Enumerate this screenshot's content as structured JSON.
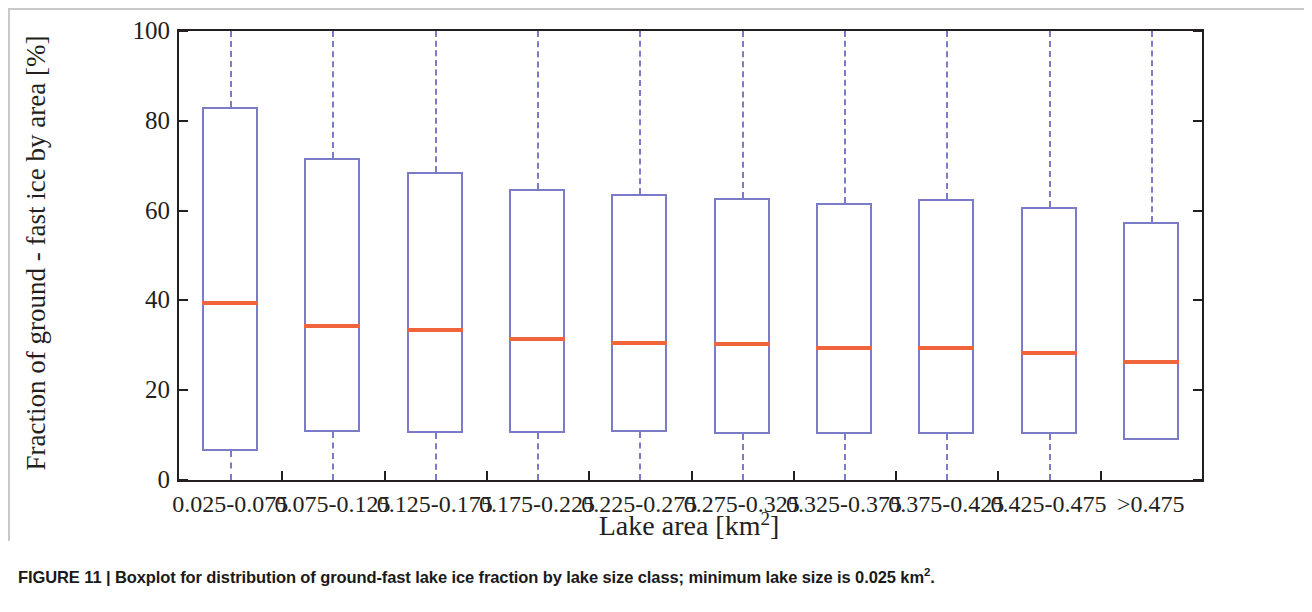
{
  "caption": {
    "figure_number": "FIGURE 11",
    "separator": "|",
    "text_before_sup": "Boxplot for distribution of ground-fast lake ice fraction by lake size class; minimum lake size is 0.025 km",
    "superscript": "2",
    "text_after_sup": "."
  },
  "colors": {
    "box_edge": "#7b7bc8",
    "median": "#f0643c",
    "axis": "#231f20",
    "background": "#ffffff",
    "outer_frame": "#c9c9c9"
  },
  "chart_data": {
    "type": "box",
    "title": "",
    "subtitle": "",
    "xlabel_text": "Lake area [km",
    "xlabel_sup": "2",
    "xlabel_tail": "]",
    "ylabel": "Fraction of ground - fast ice by area [%]",
    "ylim": [
      0,
      100
    ],
    "yticks": [
      0,
      20,
      40,
      60,
      80,
      100
    ],
    "ytick_labels": [
      "0",
      "20",
      "40",
      "60",
      "80",
      "100"
    ],
    "grid": false,
    "legend": "none",
    "categories": [
      "0.025-0.075",
      "0.075-0.125",
      "0.125-0.175",
      "0.175-0.225",
      "0.225-0.275",
      "0.275-0.325",
      "0.325-0.375",
      "0.375-0.425",
      "0.425-0.475",
      ">0.475"
    ],
    "boxes": [
      {
        "category": "0.025-0.075",
        "whisker_low": 0.0,
        "q1": 6.5,
        "median": 39.8,
        "q3": 83.0,
        "whisker_high": 100.0
      },
      {
        "category": "0.075-0.125",
        "whisker_low": 0.0,
        "q1": 10.7,
        "median": 34.8,
        "q3": 71.7,
        "whisker_high": 100.0
      },
      {
        "category": "0.125-0.175",
        "whisker_low": 0.0,
        "q1": 10.5,
        "median": 33.8,
        "q3": 68.7,
        "whisker_high": 100.0
      },
      {
        "category": "0.175-0.225",
        "whisker_low": 0.0,
        "q1": 10.4,
        "median": 31.8,
        "q3": 64.8,
        "whisker_high": 100.0
      },
      {
        "category": "0.225-0.275",
        "whisker_low": 0.0,
        "q1": 10.7,
        "median": 30.9,
        "q3": 63.8,
        "whisker_high": 100.0
      },
      {
        "category": "0.275-0.325",
        "whisker_low": 0.0,
        "q1": 10.3,
        "median": 30.8,
        "q3": 62.8,
        "whisker_high": 100.0
      },
      {
        "category": "0.325-0.375",
        "whisker_low": 0.0,
        "q1": 10.2,
        "median": 29.8,
        "q3": 61.8,
        "whisker_high": 100.0
      },
      {
        "category": "0.375-0.425",
        "whisker_low": 0.0,
        "q1": 10.2,
        "median": 29.8,
        "q3": 62.6,
        "whisker_high": 100.0
      },
      {
        "category": "0.425-0.475",
        "whisker_low": 0.0,
        "q1": 10.3,
        "median": 28.7,
        "q3": 60.8,
        "whisker_high": 100.0
      },
      {
        "category": ">0.475",
        "whisker_low": 9.0,
        "q1": 9.0,
        "median": 26.8,
        "q3": 57.5,
        "whisker_high": 100.0
      }
    ]
  }
}
